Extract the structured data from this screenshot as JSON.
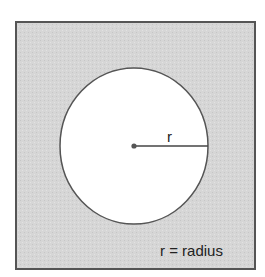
{
  "diagram": {
    "type": "circle-radius-illustration",
    "frame": {
      "x": 16,
      "y": 22,
      "width": 239,
      "height": 247,
      "fill": "#d6d6d6",
      "stroke": "#555555"
    },
    "circle": {
      "cx": 134,
      "cy": 146,
      "rx": 74,
      "ry": 78,
      "fill": "#ffffff",
      "stroke": "#555555"
    },
    "center_point": {
      "cx": 134,
      "cy": 146,
      "color": "#555555"
    },
    "radius_line": {
      "x1": 134,
      "y1": 146,
      "x2": 208,
      "y2": 146,
      "color": "#444444"
    },
    "radius_label": {
      "text": "r",
      "x": 170,
      "y": 142
    },
    "legend": {
      "text": "r = radius",
      "x": 160,
      "y": 256
    }
  }
}
